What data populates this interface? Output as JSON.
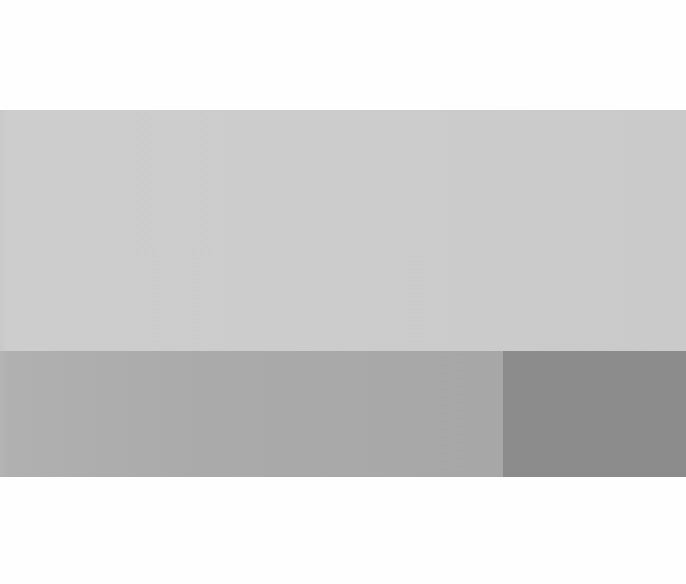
{
  "canvas": {
    "width": 686,
    "height": 584,
    "background": "#fefefe"
  },
  "swatches": [
    {
      "name": "top-panel",
      "color": "#cccccc",
      "x": 0,
      "y": 110,
      "width": 686,
      "height": 241
    },
    {
      "name": "bottom-left-panel",
      "color": "#aaaaaa",
      "x": 0,
      "y": 351,
      "width": 503,
      "height": 126
    },
    {
      "name": "bottom-right-panel",
      "color": "#8c8c8c",
      "x": 503,
      "y": 351,
      "width": 183,
      "height": 126
    }
  ],
  "text": {
    "visible_text": ""
  }
}
